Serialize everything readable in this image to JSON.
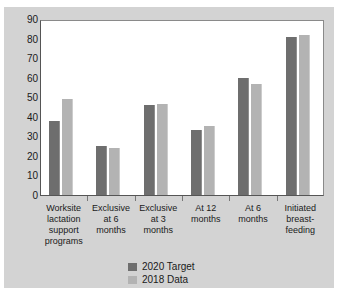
{
  "chart_data": {
    "type": "bar",
    "title": "",
    "subtitle": "",
    "xlabel": "",
    "ylabel": "",
    "ylim": [
      0,
      90
    ],
    "yticks": [
      0,
      10,
      20,
      30,
      40,
      50,
      60,
      70,
      80,
      90
    ],
    "grid": false,
    "legend_position": "bottom-center",
    "orientation": "vertical",
    "categories": [
      "Worksite lactation support programs",
      "Exclusive at 6 months",
      "Exclusive at 3 months",
      "At 12 months",
      "At 6 months",
      "Initiated breast-feeding"
    ],
    "category_lines": [
      [
        "Worksite",
        "lactation",
        "support",
        "programs"
      ],
      [
        "Exclusive",
        "at 6",
        "months"
      ],
      [
        "Exclusive",
        "at 3",
        "months"
      ],
      [
        "At 12",
        "months"
      ],
      [
        "At 6",
        "months"
      ],
      [
        "Initiated",
        "breast-",
        "feeding"
      ]
    ],
    "series": [
      {
        "name": "2020 Target",
        "color": "#6e6e6e",
        "values": [
          38,
          25,
          46,
          33.5,
          60,
          81
        ]
      },
      {
        "name": "2018 Data",
        "color": "#b3b3b3",
        "values": [
          49,
          24,
          46.5,
          35.5,
          57,
          82
        ]
      }
    ]
  },
  "legend": {
    "items": [
      {
        "label": "2020 Target"
      },
      {
        "label": "2018 Data"
      }
    ]
  },
  "colors": {
    "series_target": "#6e6e6e",
    "series_data": "#b3b3b3",
    "figure_background": "#d3d3d3",
    "plot_background": "#ffffff",
    "axis": "#555555",
    "text": "#1a1a1a"
  }
}
